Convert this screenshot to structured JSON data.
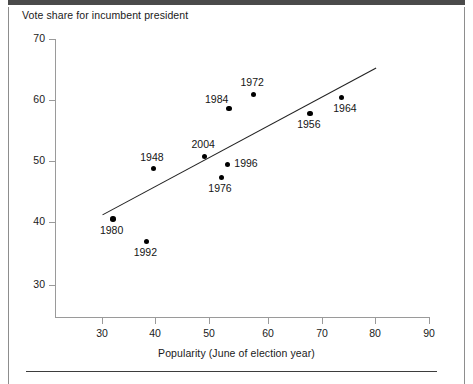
{
  "figure": {
    "title": "Vote share for incumbent president",
    "xlabel": "Popularity (June of election year)"
  },
  "chart_data": {
    "type": "scatter",
    "title": "Vote share for incumbent president",
    "xlabel": "Popularity (June of election year)",
    "ylabel": "Vote share for incumbent president",
    "xlim": [
      23,
      90
    ],
    "ylim": [
      27,
      70
    ],
    "xticks": [
      30,
      40,
      50,
      60,
      70,
      80,
      90
    ],
    "yticks": [
      30,
      40,
      50,
      60,
      70
    ],
    "grid": false,
    "legend": null,
    "points": [
      {
        "label": "1980",
        "x": 32.0,
        "y": 40.7,
        "label_pos": "below"
      },
      {
        "label": "1992",
        "x": 38.2,
        "y": 37.1,
        "label_pos": "below"
      },
      {
        "label": "1948",
        "x": 39.4,
        "y": 48.9,
        "label_pos": "above"
      },
      {
        "label": "2004",
        "x": 48.8,
        "y": 50.9,
        "label_pos": "above"
      },
      {
        "label": "1976",
        "x": 51.9,
        "y": 47.5,
        "label_pos": "below"
      },
      {
        "label": "1996",
        "x": 53.0,
        "y": 49.6,
        "label_pos": "right"
      },
      {
        "label": "1984",
        "x": 53.3,
        "y": 58.7,
        "label_pos": "above-left"
      },
      {
        "label": "1972",
        "x": 57.8,
        "y": 61.0,
        "label_pos": "above"
      },
      {
        "label": "1956",
        "x": 68.2,
        "y": 57.9,
        "label_pos": "below"
      },
      {
        "label": "1964",
        "x": 73.9,
        "y": 60.5,
        "label_pos": "below-right"
      }
    ],
    "trend_line": {
      "type": "linear-fit",
      "x_start": 30.1,
      "y_start": 41.4,
      "x_end": 80.3,
      "y_end": 65.3
    }
  },
  "axes": {
    "y_ticks": [
      {
        "value": "70",
        "px_y": 39
      },
      {
        "value": "60",
        "px_y": 100
      },
      {
        "value": "50",
        "px_y": 161
      },
      {
        "value": "40",
        "px_y": 222
      },
      {
        "value": "30",
        "px_y": 285
      }
    ],
    "x_ticks": [
      {
        "value": "30",
        "px_x": 102
      },
      {
        "value": "40",
        "px_x": 155
      },
      {
        "value": "50",
        "px_x": 209
      },
      {
        "value": "60",
        "px_x": 268
      },
      {
        "value": "70",
        "px_x": 322
      },
      {
        "value": "80",
        "px_x": 375
      },
      {
        "value": "90",
        "px_x": 429
      }
    ]
  },
  "colors": {
    "point": "#000000",
    "axis": "#9a9a9a",
    "trend": "#222222",
    "text": "#141414",
    "top_bar": "#4a4a4a",
    "border": "#8d8d8d"
  }
}
